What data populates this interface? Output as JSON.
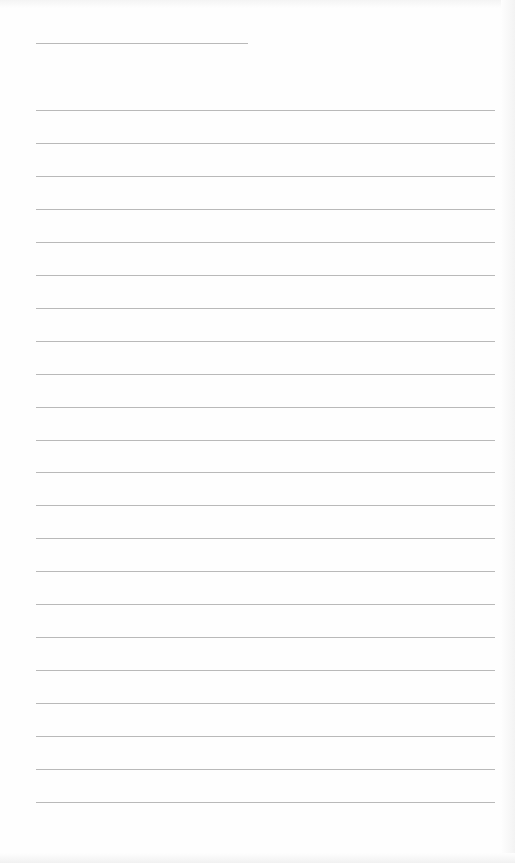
{
  "page": {
    "type": "lined-paper",
    "background_color": "#fefefe",
    "line_color": "#b9b9b9",
    "header_line": {
      "top": 43,
      "left": 36,
      "width": 212
    },
    "ruled_lines": {
      "count": 22,
      "first_top": 110,
      "spacing": 32.95,
      "left": 36,
      "width": 459
    }
  }
}
